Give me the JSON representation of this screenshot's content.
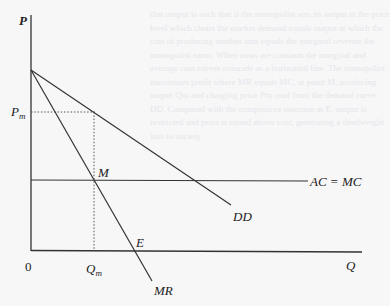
{
  "diagram": {
    "type": "monopoly-pricing-diagram",
    "axes": {
      "y_label": "P",
      "x_label": "Q",
      "origin_label": "0"
    },
    "curves": [
      {
        "id": "DD",
        "label": "DD",
        "description": "Demand curve, downward sloping from price-axis intercept"
      },
      {
        "id": "MR",
        "label": "MR",
        "description": "Marginal revenue curve, steeper, same intercept as DD"
      },
      {
        "id": "AC_MC",
        "label": "AC = MC",
        "description": "Horizontal constant average and marginal cost line"
      }
    ],
    "points": [
      {
        "id": "M",
        "label": "M",
        "description": "Intersection of MR with AC = MC"
      },
      {
        "id": "E",
        "label": "E",
        "description": "Where MR crosses the quantity axis"
      }
    ],
    "reference_lines": [
      {
        "id": "Pm",
        "label_main": "P",
        "label_sub": "m",
        "style": "dotted",
        "orientation": "horizontal"
      },
      {
        "id": "Qm",
        "label_main": "Q",
        "label_sub": "m",
        "style": "dotted",
        "orientation": "vertical"
      }
    ],
    "background_text": "that output is such that if the monopolist sets its output at the price level which clears the market demand equals output at which the cost of producing another unit equals the marginal revenue the monopolist earns. When costs are constant the marginal and average cost curves coincide as a horizontal line. The monopolist maximizes profit where MR equals MC, at point M, producing output Qm and charging price Pm read from the demand curve DD. Compared with the competitive outcome at E, output is restricted and price is raised above cost, generating a deadweight loss to society."
  }
}
